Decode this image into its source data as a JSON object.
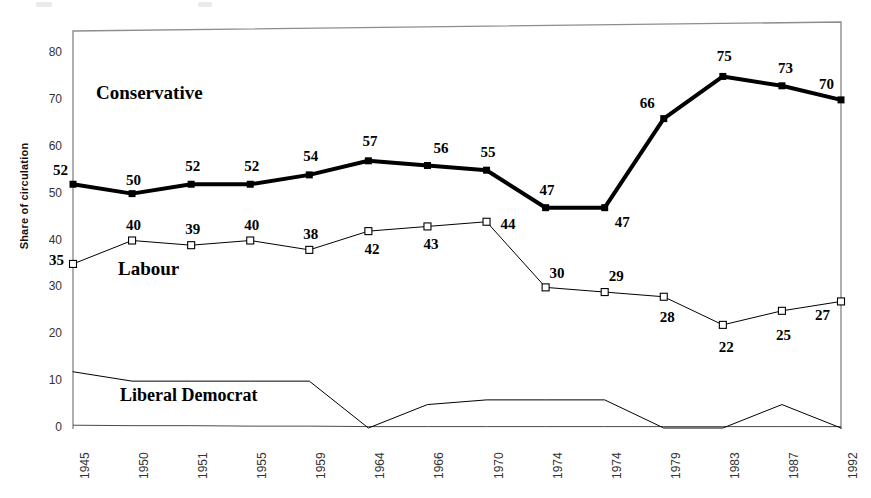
{
  "chart_data": {
    "type": "line",
    "title": "",
    "xlabel": "",
    "ylabel": "Share of circulation",
    "ylim": [
      0,
      85
    ],
    "yticks": [
      0,
      10,
      20,
      30,
      40,
      50,
      60,
      70,
      80
    ],
    "grid": false,
    "legend_position": "inline-annotations",
    "categories": [
      "1945",
      "1950",
      "1951",
      "1955",
      "1959",
      "1964",
      "1966",
      "1970",
      "1974",
      "1974",
      "1979",
      "1983",
      "1987",
      "1992"
    ],
    "series": [
      {
        "name": "Conservative",
        "marker": "filled-square",
        "color": "#000000",
        "line_width": 4,
        "values": [
          52,
          50,
          52,
          52,
          54,
          57,
          56,
          55,
          47,
          47,
          66,
          75,
          73,
          70
        ],
        "labels": [
          "52",
          "50",
          "52",
          "52",
          "54",
          "57",
          "56",
          "55",
          "47",
          "47",
          "66",
          "75",
          "73",
          "70"
        ]
      },
      {
        "name": "Labour",
        "marker": "open-square",
        "color": "#000000",
        "line_width": 1,
        "values": [
          35,
          40,
          39,
          40,
          38,
          42,
          43,
          44,
          30,
          29,
          28,
          22,
          25,
          27
        ],
        "labels": [
          "35",
          "40",
          "39",
          "40",
          "38",
          "42",
          "43",
          "44",
          "30",
          "29",
          "28",
          "22",
          "25",
          "27"
        ]
      },
      {
        "name": "Liberal Democrat",
        "marker": "none",
        "color": "#000000",
        "line_width": 1,
        "values": [
          12,
          10,
          10,
          10,
          10,
          0,
          5,
          6,
          6,
          6,
          0,
          0,
          5,
          0
        ],
        "labels": []
      }
    ],
    "baseline_series": {
      "name": "axis-baseline",
      "values": [
        0.6,
        0.5,
        0.5,
        0.4,
        0.4,
        0.3,
        0.3,
        0.3,
        0.3,
        0.3,
        0.3,
        0.3,
        0.3,
        0.3
      ]
    }
  },
  "annotations": {
    "conservative": "Conservative",
    "labour": "Labour",
    "liberal_democrat": "Liberal Democrat"
  }
}
